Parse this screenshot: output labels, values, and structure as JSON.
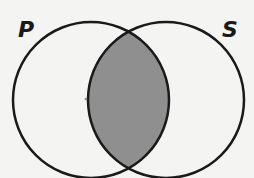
{
  "diagram": {
    "type": "venn",
    "sets": [
      {
        "label": "P",
        "cx": 91,
        "cy": 100,
        "r": 78
      },
      {
        "label": "S",
        "cx": 166,
        "cy": 100,
        "r": 78
      }
    ],
    "shaded_region": "P∩S",
    "colors": {
      "background": "#f4f4f3",
      "stroke": "#1a1a1a",
      "shade": "#8f8f8f"
    }
  }
}
